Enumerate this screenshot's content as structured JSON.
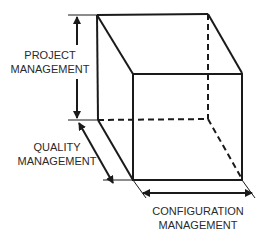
{
  "diagram": {
    "type": "cube-3-axis",
    "axes": {
      "vertical": {
        "line1": "PROJECT",
        "line2": "MANAGEMENT"
      },
      "depth": {
        "line1": "QUALITY",
        "line2": "MANAGEMENT"
      },
      "horizontal": {
        "line1": "CONFIGURATION",
        "line2": "MANAGEMENT"
      }
    },
    "colors": {
      "stroke": "#1a1a1a",
      "text": "#2a2a2a",
      "background": "#ffffff"
    }
  }
}
